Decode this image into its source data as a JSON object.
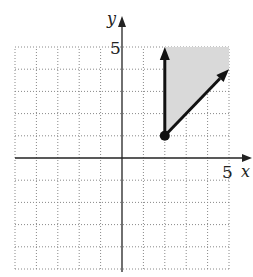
{
  "chart_data": {
    "type": "line",
    "title": "",
    "xlabel": "x",
    "ylabel": "y",
    "xlim": [
      -5,
      5
    ],
    "ylim": [
      -5,
      5
    ],
    "grid": true,
    "grid_style": "dotted",
    "tick_labels": {
      "x": [
        "5"
      ],
      "y": [
        "5"
      ]
    },
    "vertex": {
      "x": 2,
      "y": 1,
      "style": "filled-dot"
    },
    "rays": [
      {
        "name": "vertical-ray",
        "from": [
          2,
          1
        ],
        "to": [
          2,
          5
        ],
        "arrow": true
      },
      {
        "name": "diagonal-ray",
        "from": [
          2,
          1
        ],
        "to": [
          5,
          4
        ],
        "arrow": true
      }
    ],
    "shaded_region": {
      "description": "Region between the two rays (x >= 2, y >= x - 1), clipped to the grid",
      "polygon": [
        [
          2,
          1
        ],
        [
          2,
          5
        ],
        [
          5,
          5
        ],
        [
          5,
          4
        ]
      ],
      "color": "#d9d9d9"
    }
  },
  "labels": {
    "x_axis": "x",
    "y_axis": "y",
    "x_tick": "5",
    "y_tick": "5"
  },
  "colors": {
    "axis": "#222222",
    "grid": "#888888",
    "shade": "#d9d9d9",
    "ray": "#111111"
  }
}
